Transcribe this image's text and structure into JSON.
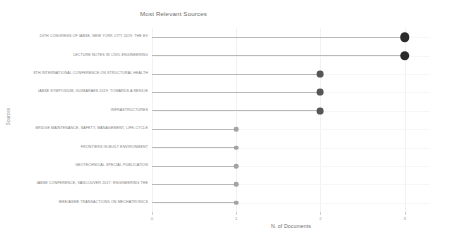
{
  "chart_data": {
    "type": "bar",
    "subtype": "lollipop-horizontal",
    "title": "Most Relevant Sources",
    "xlabel": "N. of Documents",
    "ylabel": "Sources",
    "xlim": [
      0,
      3.3
    ],
    "xticks": [
      0,
      1,
      2,
      3
    ],
    "xtick_labels": [
      "0",
      "1",
      "2",
      "3"
    ],
    "grid": "vertical-faint",
    "legend": "none",
    "orientation": "horizontal",
    "categories": [
      "20TH CONGRESS OF IABSE, NEW YORK CITY 2019: THE EV",
      "LECTURE NOTES IN CIVIL ENGINEERING",
      "8TH INTERNATIONAL CONFERENCE ON STRUCTURAL HEALTH",
      "IABSE SYMPOSIUM, GUIMARAES 2019: TOWARDS A RESILIE",
      "INFRASTRUCTURES",
      "BRIDGE MAINTENANCE, SAFETY, MANAGEMENT, LIFE-CYCLE",
      "FRONTIERS IN BUILT ENVIRONMENT",
      "GEOTECHNICAL SPECIAL PUBLICATION",
      "IABSE CONFERENCE, VANCOUVER 2017: ENGINEERING THE",
      "IEEE/ASME TRANSACTIONS ON MECHATRONICS"
    ],
    "values": [
      3,
      3,
      2,
      2,
      2,
      1,
      1,
      1,
      1,
      1
    ],
    "marker_colors": [
      "#2b2b2b",
      "#2b2b2b",
      "#565656",
      "#565656",
      "#565656",
      "#a3a3a3",
      "#a3a3a3",
      "#a3a3a3",
      "#a3a3a3",
      "#a3a3a3"
    ],
    "marker_sizes": [
      9.5,
      9.5,
      6.8,
      6.8,
      6.8,
      4.6,
      4.6,
      4.6,
      4.6,
      4.6
    ],
    "stem_color": "#b9b9b9",
    "gridline_color": "#f2f2f2",
    "background": "#ffffff",
    "text_color": "#7d7d7d"
  }
}
